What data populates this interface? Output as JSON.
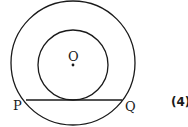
{
  "diagram": {
    "labels": {
      "center": "O",
      "left_point": "P",
      "right_point": "Q",
      "figure_number": "(4)"
    },
    "outer_circle": {
      "cx": 73,
      "cy": 63,
      "r": 62
    },
    "inner_circle": {
      "cx": 73,
      "cy": 65,
      "r": 35
    },
    "chord": {
      "x1": 26,
      "y1": 100,
      "x2": 122,
      "y2": 100
    },
    "stroke_color": "#1a1a1a"
  }
}
